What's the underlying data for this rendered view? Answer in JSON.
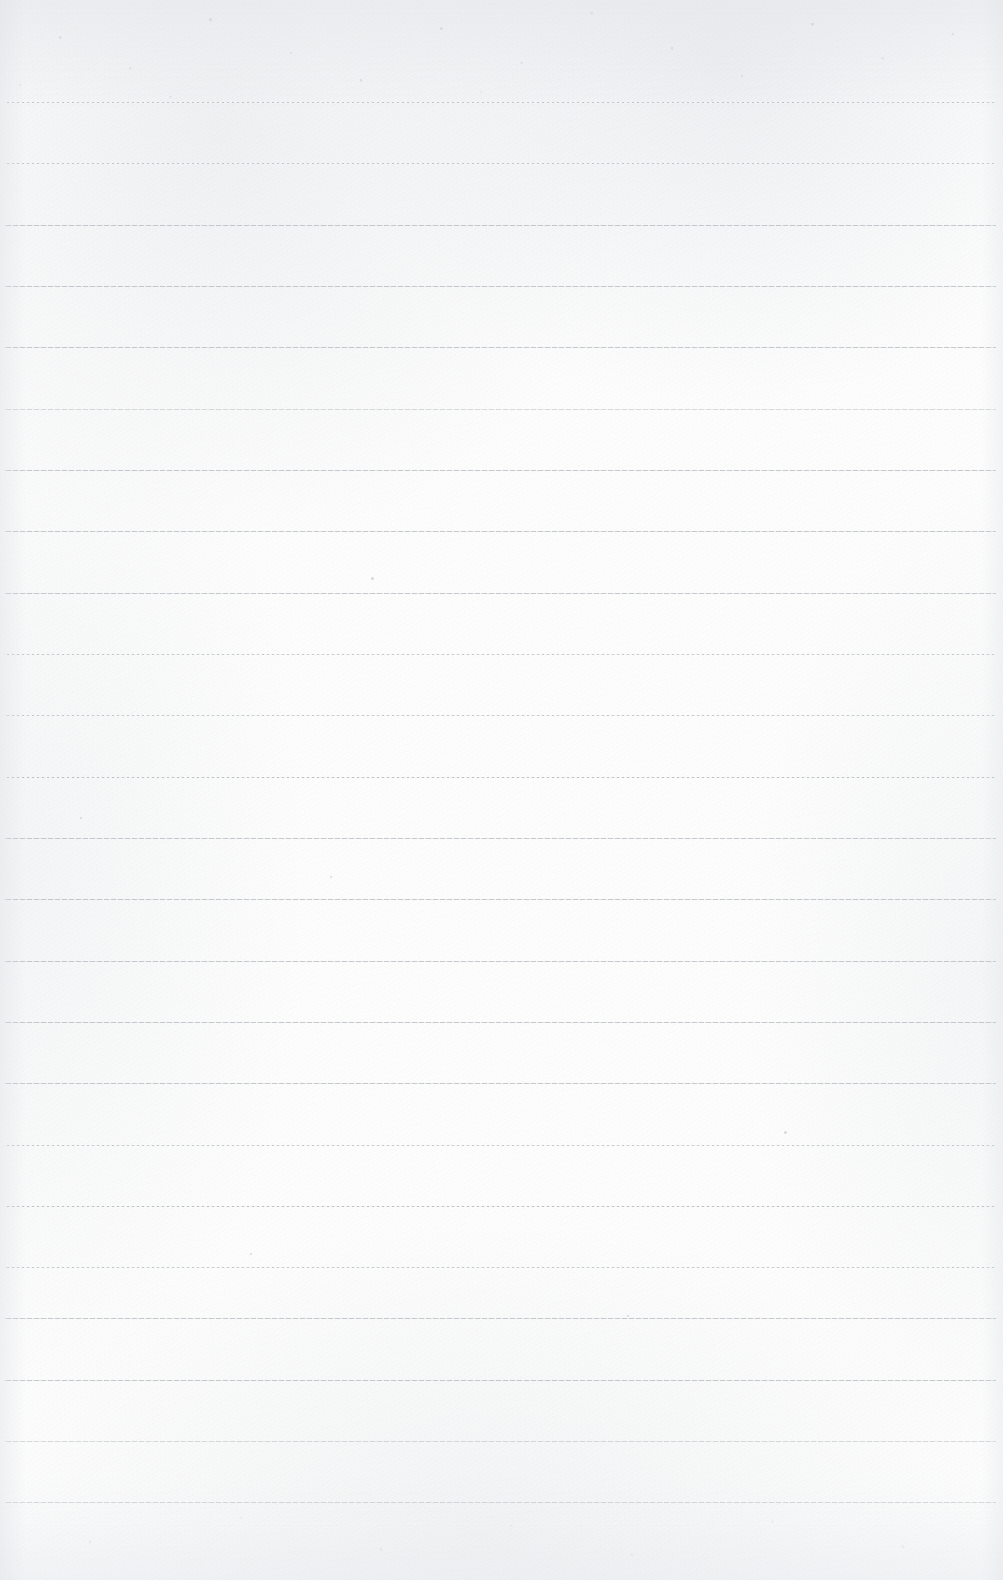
{
  "document": {
    "kind": "ruled-notebook-page",
    "title": "Blank lined paper",
    "page_width": 1003,
    "page_height": 1580,
    "visible_text": "",
    "handwriting_present": "no",
    "colors": {
      "paper": "#fcfcfc",
      "paper_highlight": "#fdfdfd",
      "paper_shadow": "#f7f8f9",
      "rule_line": "#b9bdc2",
      "speck": "#b3b8be"
    },
    "rules": {
      "count": 24,
      "first_line_y": 102,
      "spacing": 61.3,
      "left_x": 4,
      "right_x": 996,
      "thickness": 1,
      "lines": [
        {
          "y": 102,
          "weight": "normal",
          "texture": "broken"
        },
        {
          "y": 163,
          "weight": "normal",
          "texture": "broken"
        },
        {
          "y": 225,
          "weight": "normal",
          "texture": "solid"
        },
        {
          "y": 286,
          "weight": "normal",
          "texture": "solid"
        },
        {
          "y": 347,
          "weight": "normal",
          "texture": "solid"
        },
        {
          "y": 409,
          "weight": "faint",
          "texture": "solid"
        },
        {
          "y": 470,
          "weight": "normal",
          "texture": "solid"
        },
        {
          "y": 531,
          "weight": "normal",
          "texture": "solid"
        },
        {
          "y": 593,
          "weight": "normal",
          "texture": "solid"
        },
        {
          "y": 654,
          "weight": "normal",
          "texture": "broken"
        },
        {
          "y": 715,
          "weight": "normal",
          "texture": "broken"
        },
        {
          "y": 777,
          "weight": "dark",
          "texture": "broken"
        },
        {
          "y": 838,
          "weight": "normal",
          "texture": "solid"
        },
        {
          "y": 899,
          "weight": "normal",
          "texture": "solid"
        },
        {
          "y": 961,
          "weight": "normal",
          "texture": "solid"
        },
        {
          "y": 1022,
          "weight": "normal",
          "texture": "solid"
        },
        {
          "y": 1083,
          "weight": "normal",
          "texture": "solid"
        },
        {
          "y": 1145,
          "weight": "normal",
          "texture": "broken"
        },
        {
          "y": 1206,
          "weight": "dark",
          "texture": "broken"
        },
        {
          "y": 1267,
          "weight": "normal",
          "texture": "broken"
        },
        {
          "y": 1318,
          "weight": "normal",
          "texture": "solid"
        },
        {
          "y": 1380,
          "weight": "normal",
          "texture": "solid"
        },
        {
          "y": 1441,
          "weight": "faint",
          "texture": "solid"
        },
        {
          "y": 1502,
          "weight": "faint",
          "texture": "solid"
        }
      ]
    },
    "specks": [
      {
        "x": 784,
        "y": 1131,
        "size": 3
      },
      {
        "x": 371,
        "y": 577,
        "size": 3
      },
      {
        "x": 330,
        "y": 876,
        "size": 2
      },
      {
        "x": 627,
        "y": 1315,
        "size": 2
      },
      {
        "x": 250,
        "y": 1253,
        "size": 2
      },
      {
        "x": 80,
        "y": 817,
        "size": 2
      }
    ]
  }
}
